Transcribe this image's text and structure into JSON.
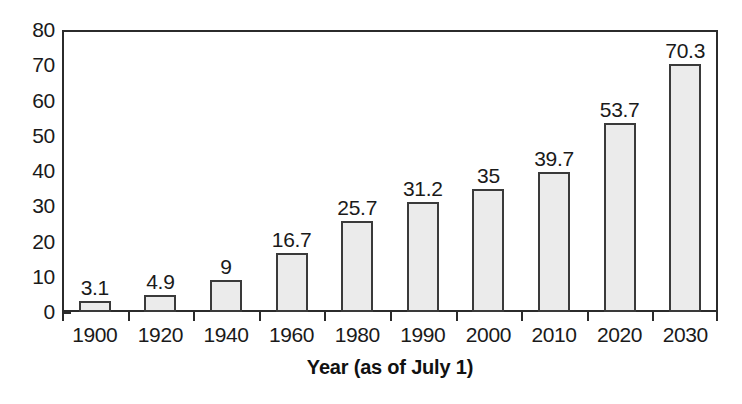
{
  "chart_data": {
    "type": "bar",
    "title": "",
    "subtitle": "",
    "xlabel": "Year (as of July 1)",
    "ylabel": "",
    "categories": [
      "1900",
      "1920",
      "1940",
      "1960",
      "1980",
      "1990",
      "2000",
      "2010",
      "2020",
      "2030"
    ],
    "values": [
      3.1,
      4.9,
      9,
      16.7,
      25.7,
      31.2,
      35,
      39.7,
      53.7,
      70.3
    ],
    "data_labels": [
      "3.1",
      "4.9",
      "9",
      "16.7",
      "25.7",
      "31.2",
      "35",
      "39.7",
      "53.7",
      "70.3"
    ],
    "series": [
      {
        "name": "",
        "values": [
          3.1,
          4.9,
          9,
          16.7,
          25.7,
          31.2,
          35,
          39.7,
          53.7,
          70.3
        ]
      }
    ],
    "ylim": [
      0,
      80
    ],
    "ytick_labels": [
      "0",
      "10",
      "20",
      "30",
      "40",
      "50",
      "60",
      "70",
      "80"
    ],
    "ytick_values": [
      0,
      10,
      20,
      30,
      40,
      50,
      60,
      70,
      80
    ],
    "grid": false,
    "legend": false,
    "legend_position": "none",
    "bar_fill_color": "#ebebeb",
    "bar_edge_color": "#3a3a3a",
    "axis_color": "#2b2b2b",
    "text_color": "#1a1a1a",
    "background_color": "#ffffff",
    "annotations": []
  }
}
